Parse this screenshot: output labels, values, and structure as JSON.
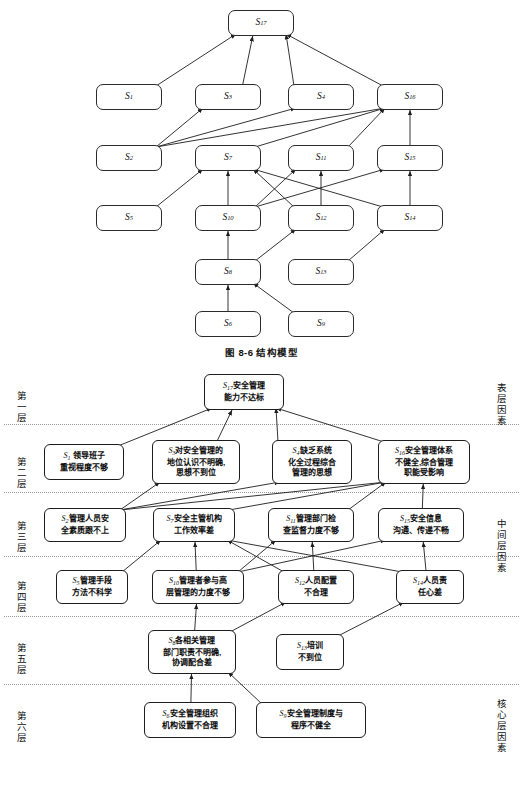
{
  "figure_structure": {
    "caption": "图 8-6    结构模型",
    "nodes": [
      {
        "id": "S17",
        "label": "S",
        "sub": "17",
        "x": 228,
        "y": 10,
        "w": 66,
        "h": 26
      },
      {
        "id": "S1",
        "label": "S",
        "sub": "1",
        "x": 96,
        "y": 84,
        "w": 66,
        "h": 26
      },
      {
        "id": "S3",
        "label": "S",
        "sub": "3",
        "x": 195,
        "y": 84,
        "w": 66,
        "h": 26
      },
      {
        "id": "S4",
        "label": "S",
        "sub": "4",
        "x": 288,
        "y": 84,
        "w": 66,
        "h": 26
      },
      {
        "id": "S16",
        "label": "S",
        "sub": "16",
        "x": 377,
        "y": 84,
        "w": 66,
        "h": 26
      },
      {
        "id": "S2",
        "label": "S",
        "sub": "2",
        "x": 96,
        "y": 145,
        "w": 66,
        "h": 26
      },
      {
        "id": "S7",
        "label": "S",
        "sub": "7",
        "x": 195,
        "y": 145,
        "w": 66,
        "h": 26
      },
      {
        "id": "S11",
        "label": "S",
        "sub": "11",
        "x": 288,
        "y": 145,
        "w": 66,
        "h": 26
      },
      {
        "id": "S15",
        "label": "S",
        "sub": "15",
        "x": 377,
        "y": 145,
        "w": 66,
        "h": 26
      },
      {
        "id": "S5",
        "label": "S",
        "sub": "5",
        "x": 96,
        "y": 205,
        "w": 66,
        "h": 26
      },
      {
        "id": "S10",
        "label": "S",
        "sub": "10",
        "x": 195,
        "y": 205,
        "w": 66,
        "h": 26
      },
      {
        "id": "S12",
        "label": "S",
        "sub": "12",
        "x": 288,
        "y": 205,
        "w": 66,
        "h": 26
      },
      {
        "id": "S14",
        "label": "S",
        "sub": "14",
        "x": 377,
        "y": 205,
        "w": 66,
        "h": 26
      },
      {
        "id": "S8",
        "label": "S",
        "sub": "8",
        "x": 195,
        "y": 259,
        "w": 66,
        "h": 26
      },
      {
        "id": "S13",
        "label": "S",
        "sub": "13",
        "x": 288,
        "y": 259,
        "w": 66,
        "h": 26
      },
      {
        "id": "S6",
        "label": "S",
        "sub": "6",
        "x": 195,
        "y": 311,
        "w": 66,
        "h": 26
      },
      {
        "id": "S9",
        "label": "S",
        "sub": "9",
        "x": 288,
        "y": 311,
        "w": 66,
        "h": 26
      }
    ],
    "edges": [
      {
        "from": "S1",
        "to": "S17"
      },
      {
        "from": "S3",
        "to": "S17"
      },
      {
        "from": "S4",
        "to": "S17"
      },
      {
        "from": "S16",
        "to": "S17"
      },
      {
        "from": "S2",
        "to": "S3"
      },
      {
        "from": "S2",
        "to": "S4"
      },
      {
        "from": "S2",
        "to": "S16"
      },
      {
        "from": "S7",
        "to": "S16"
      },
      {
        "from": "S11",
        "to": "S16"
      },
      {
        "from": "S15",
        "to": "S16"
      },
      {
        "from": "S5",
        "to": "S7"
      },
      {
        "from": "S10",
        "to": "S7"
      },
      {
        "from": "S12",
        "to": "S7"
      },
      {
        "from": "S14",
        "to": "S7"
      },
      {
        "from": "S10",
        "to": "S11"
      },
      {
        "from": "S12",
        "to": "S11"
      },
      {
        "from": "S10",
        "to": "S15"
      },
      {
        "from": "S14",
        "to": "S15"
      },
      {
        "from": "S8",
        "to": "S10"
      },
      {
        "from": "S8",
        "to": "S12"
      },
      {
        "from": "S13",
        "to": "S14"
      },
      {
        "from": "S6",
        "to": "S8"
      },
      {
        "from": "S9",
        "to": "S8"
      }
    ]
  },
  "figure_hierarchy": {
    "level_labels": [
      {
        "text": "第一层",
        "y": 22
      },
      {
        "text": "第二层",
        "y": 88
      },
      {
        "text": "第三层",
        "y": 152
      },
      {
        "text": "第四层",
        "y": 212
      },
      {
        "text": "第五层",
        "y": 274
      },
      {
        "text": "第六层",
        "y": 342
      }
    ],
    "side_labels": [
      {
        "text": "表层因素",
        "y": 14
      },
      {
        "text": "中间层因素",
        "y": 150
      },
      {
        "text": "核心层因素",
        "y": 330
      }
    ],
    "dividers_y": [
      56,
      124,
      188,
      248,
      316
    ],
    "boxes": [
      {
        "id": "S17",
        "idx": "S",
        "sub": "17",
        "text": "安全管理能力不达标",
        "lines": [
          "安全管理",
          "能力不达标"
        ],
        "x": 204,
        "y": 6,
        "w": 80,
        "h": 36
      },
      {
        "id": "S1",
        "idx": "S",
        "sub": "1",
        "text": " 领导班子重视程度不够",
        "lines": [
          " 领导班子",
          "重视程度不够"
        ],
        "x": 44,
        "y": 76,
        "w": 80,
        "h": 36
      },
      {
        "id": "S3",
        "idx": "S",
        "sub": "3",
        "text": "对安全管理的地位认识不明确，思想不到位",
        "lines": [
          "对安全管理的",
          "地位认识不明确,",
          "思想不到位"
        ],
        "x": 152,
        "y": 72,
        "w": 88,
        "h": 44
      },
      {
        "id": "S4",
        "idx": "S",
        "sub": "4",
        "text": "缺乏系统化全过程综合管理的思想",
        "lines": [
          "缺乏系统",
          "化全过程综合",
          "管理的思想"
        ],
        "x": 272,
        "y": 72,
        "w": 80,
        "h": 44
      },
      {
        "id": "S16",
        "idx": "S",
        "sub": "16",
        "text": "安全管理体系不健全，综合管理职能受影响",
        "lines": [
          "安全管理体系",
          "不健全,综合管理",
          "职能受影响"
        ],
        "x": 378,
        "y": 72,
        "w": 92,
        "h": 44
      },
      {
        "id": "S2",
        "idx": "S",
        "sub": "2",
        "text": "管理人员安全素质跟不上",
        "lines": [
          "管理人员安",
          "全素质跟不上"
        ],
        "x": 44,
        "y": 140,
        "w": 82,
        "h": 34
      },
      {
        "id": "S7",
        "idx": "S",
        "sub": "7",
        "text": "安全主管机构工作效率差",
        "lines": [
          "安全主管机构",
          "工作效率差"
        ],
        "x": 153,
        "y": 140,
        "w": 82,
        "h": 34
      },
      {
        "id": "S11",
        "idx": "S",
        "sub": "11",
        "text": "管理部门检查监督力度不够",
        "lines": [
          "管理部门检",
          "查监督力度不够"
        ],
        "x": 268,
        "y": 140,
        "w": 86,
        "h": 34
      },
      {
        "id": "S15",
        "idx": "S",
        "sub": "15",
        "text": "安全信息沟通、传递不畅",
        "lines": [
          "安全信息",
          "沟通、传递不畅"
        ],
        "x": 378,
        "y": 140,
        "w": 86,
        "h": 34
      },
      {
        "id": "S5",
        "idx": "S",
        "sub": "5",
        "text": "管理手段方法不科学",
        "lines": [
          "管理手段",
          "方法不科学"
        ],
        "x": 56,
        "y": 202,
        "w": 72,
        "h": 34
      },
      {
        "id": "S10",
        "idx": "S",
        "sub": "10",
        "text": "管理者参与高层管理的力度不够",
        "lines": [
          "管理者参与高",
          "层管理的力度不够"
        ],
        "x": 152,
        "y": 202,
        "w": 92,
        "h": 34
      },
      {
        "id": "S12",
        "idx": "S",
        "sub": "12",
        "text": "人员配置不合理",
        "lines": [
          "人员配置",
          "不合理"
        ],
        "x": 278,
        "y": 202,
        "w": 76,
        "h": 34
      },
      {
        "id": "S14",
        "idx": "S",
        "sub": "14",
        "text": "人员责任心差",
        "lines": [
          "人员责",
          "任心差"
        ],
        "x": 396,
        "y": 202,
        "w": 68,
        "h": 34
      },
      {
        "id": "S8",
        "idx": "S",
        "sub": "8",
        "text": "各相关管理部门职责不明确，协调配合差",
        "lines": [
          "各相关管理",
          "部门职责不明确,",
          "协调配合差"
        ],
        "x": 148,
        "y": 262,
        "w": 88,
        "h": 44
      },
      {
        "id": "S13",
        "idx": "S",
        "sub": "13",
        "text": "培训不到位",
        "lines": [
          "培训",
          "不到位"
        ],
        "x": 276,
        "y": 266,
        "w": 68,
        "h": 36
      },
      {
        "id": "S6",
        "idx": "S",
        "sub": "6",
        "text": "安全管理组织机构设置不合理",
        "lines": [
          "安全管理组织",
          "机构设置不合理"
        ],
        "x": 144,
        "y": 334,
        "w": 92,
        "h": 36
      },
      {
        "id": "S9",
        "idx": "S",
        "sub": "9",
        "text": "安全管理制度与程序不健全",
        "lines": [
          "安全管理制度与",
          "程序不健全"
        ],
        "x": 256,
        "y": 334,
        "w": 110,
        "h": 36
      }
    ],
    "edges": [
      {
        "from": "S1",
        "to": "S17"
      },
      {
        "from": "S3",
        "to": "S17"
      },
      {
        "from": "S4",
        "to": "S17"
      },
      {
        "from": "S16",
        "to": "S17"
      },
      {
        "from": "S2",
        "to": "S3"
      },
      {
        "from": "S2",
        "to": "S4"
      },
      {
        "from": "S2",
        "to": "S16"
      },
      {
        "from": "S7",
        "to": "S16"
      },
      {
        "from": "S11",
        "to": "S16"
      },
      {
        "from": "S15",
        "to": "S16"
      },
      {
        "from": "S5",
        "to": "S7"
      },
      {
        "from": "S10",
        "to": "S7"
      },
      {
        "from": "S12",
        "to": "S7"
      },
      {
        "from": "S14",
        "to": "S7"
      },
      {
        "from": "S10",
        "to": "S11"
      },
      {
        "from": "S12",
        "to": "S11"
      },
      {
        "from": "S10",
        "to": "S15"
      },
      {
        "from": "S14",
        "to": "S15"
      },
      {
        "from": "S8",
        "to": "S10"
      },
      {
        "from": "S8",
        "to": "S12"
      },
      {
        "from": "S13",
        "to": "S14"
      },
      {
        "from": "S6",
        "to": "S8"
      },
      {
        "from": "S9",
        "to": "S8"
      }
    ]
  },
  "colors": {
    "stroke": "#1d1d1d",
    "divider": "#9a9a9a",
    "background": "#ffffff"
  }
}
